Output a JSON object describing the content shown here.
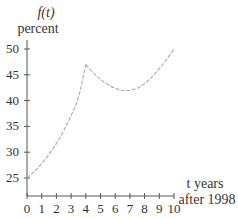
{
  "chart_data": {
    "type": "line",
    "title": "",
    "ylabel_line1": "f(t)",
    "ylabel_line2": "percent",
    "xlabel_line1": "t years",
    "xlabel_line2": "after 1998",
    "xlim": [
      0,
      10
    ],
    "ylim": [
      25,
      50
    ],
    "x_ticks": [
      0,
      1,
      2,
      3,
      4,
      5,
      6,
      7,
      8,
      9,
      10
    ],
    "y_ticks": [
      25,
      30,
      35,
      40,
      45,
      50
    ],
    "grid": false,
    "series": [
      {
        "name": "f(t)",
        "color": "#b0b0b0",
        "x": [
          0,
          0.5,
          1,
          1.5,
          2,
          2.5,
          3,
          3.5,
          4,
          4.5,
          5,
          5.5,
          6,
          6.5,
          7,
          7.5,
          8,
          8.5,
          9,
          9.5,
          10
        ],
        "y": [
          25,
          26.3,
          27.8,
          29.6,
          31.7,
          34.2,
          37.1,
          40.6,
          47,
          45.4,
          44.1,
          43.1,
          42.4,
          42.0,
          42.0,
          42.4,
          43.3,
          44.6,
          46.2,
          48.0,
          50
        ]
      }
    ]
  }
}
